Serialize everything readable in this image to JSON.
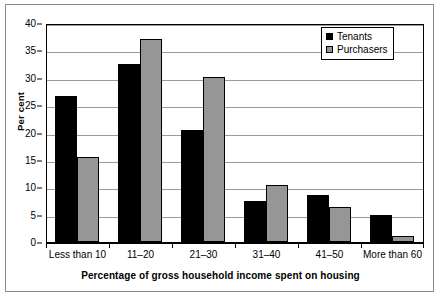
{
  "chart_data": {
    "type": "bar",
    "title": "",
    "xlabel": "Percentage of gross household income spent on housing",
    "ylabel": "Per cent",
    "categories": [
      "Less than 10",
      "11–20",
      "21–30",
      "31–40",
      "41–50",
      "More than 60"
    ],
    "series": [
      {
        "name": "Tenants",
        "color": "#000000",
        "values": [
          26.7,
          32.5,
          20.5,
          7.5,
          8.6,
          4.9
        ]
      },
      {
        "name": "Purchasers",
        "color": "#969696",
        "values": [
          15.5,
          37.1,
          30.1,
          10.5,
          6.4,
          1.1
        ]
      }
    ],
    "ylim": [
      0,
      40
    ],
    "ytick_step": 5,
    "yticks": [
      "40",
      "35",
      "30",
      "25",
      "20",
      "15",
      "10",
      "5",
      "0"
    ],
    "grid": "horizontal",
    "legend_position": "top-right"
  },
  "legend": {
    "items": [
      {
        "label": "Tenants"
      },
      {
        "label": "Purchasers"
      }
    ]
  },
  "axes": {
    "y_title": "Per cent",
    "x_title": "Percentage of gross household income spent on housing"
  }
}
